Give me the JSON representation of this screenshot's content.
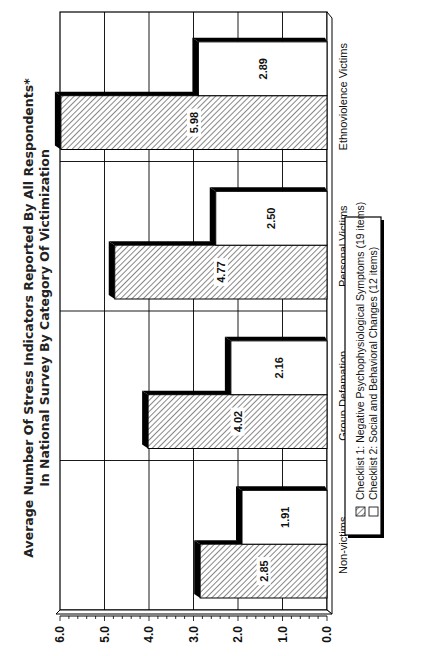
{
  "chart_data": {
    "type": "bar",
    "orientation": "rotated 90 degrees counter-clockwise (printed landscape on portrait page)",
    "title": "Average Number Of Stress Indicators Reported By All Respondents*",
    "subtitle": "In National Survey By Category Of Victimization",
    "categories": [
      "Non-victims",
      "Group Defamation",
      "Personal Victims",
      "Ethnoviolence Victims"
    ],
    "series": [
      {
        "name": "Checklist 1:  Negative Psychophysiological Symptoms (19 items)",
        "pattern": "diagonal-hatch",
        "values": [
          2.85,
          4.02,
          4.77,
          5.98
        ],
        "labels": [
          "2.85",
          "4.02",
          "4.77",
          "5.98"
        ]
      },
      {
        "name": "Checklist 2:  Social and Behavioral Changes (12 items)",
        "pattern": "white",
        "values": [
          1.91,
          2.16,
          2.5,
          2.89
        ],
        "labels": [
          "1.91",
          "2.16",
          "2.50",
          "2.89"
        ]
      }
    ],
    "xlabel": "",
    "ylabel": "",
    "ylim": [
      0.0,
      6.0
    ],
    "yticks": [
      "0.0",
      "1.0",
      "2.0",
      "3.0",
      "4.0",
      "5.0",
      "6.0"
    ],
    "grid": true,
    "style": "3D bars with black drop shadow",
    "legend_position": "right (bottom when rotated upright)"
  },
  "colors": {
    "ink": "#111111",
    "background": "#ffffff",
    "hatch": "#666666",
    "shadow": "#000000"
  }
}
